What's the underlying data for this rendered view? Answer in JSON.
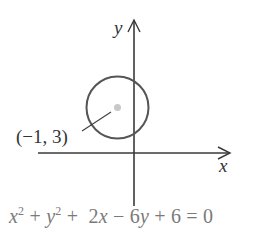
{
  "diagram": {
    "type": "circle-on-coordinate-axes",
    "axes": {
      "x_label": "x",
      "y_label": "y",
      "color": "#3a3a3a"
    },
    "circle": {
      "center_label": "(−1, 3)",
      "center": [
        -1,
        3
      ],
      "stroke_color": "#555555",
      "center_dot_color": "#c8c8c8"
    },
    "equation": {
      "terms": [
        "x",
        "2",
        "+",
        "y",
        "2",
        "+",
        "2x",
        "−",
        "6y",
        "+",
        "6",
        "=",
        "0"
      ],
      "text": "x² + y² +  2x − 6y + 6 = 0",
      "color": "#7a7a7a"
    }
  }
}
